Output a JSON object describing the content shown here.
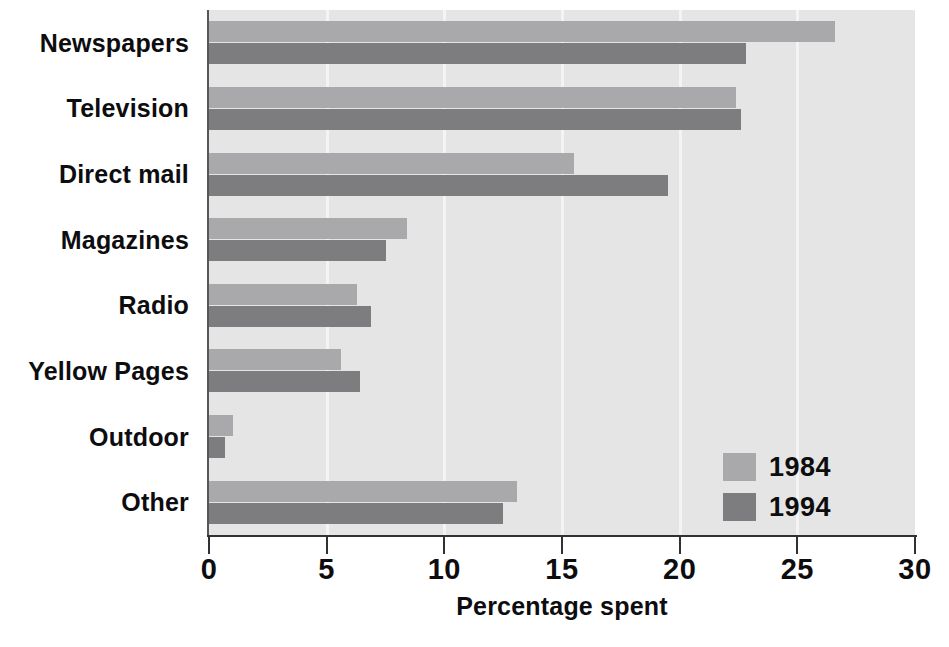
{
  "chart_data": {
    "type": "bar",
    "orientation": "horizontal",
    "title": "",
    "xlabel": "Percentage spent",
    "ylabel": "",
    "xlim": [
      0,
      30
    ],
    "xticks": [
      0,
      5,
      10,
      15,
      20,
      25,
      30
    ],
    "xtick_labels": [
      "0",
      "5",
      "10",
      "15",
      "20",
      "25",
      "30"
    ],
    "grid": true,
    "grid_axis": "x",
    "legend_position": "lower right",
    "categories": [
      "Newspapers",
      "Television",
      "Direct mail",
      "Magazines",
      "Radio",
      "Yellow Pages",
      "Outdoor",
      "Other"
    ],
    "series": [
      {
        "name": "1984",
        "color": "#a9a9ab",
        "values": [
          26.6,
          22.4,
          15.5,
          8.4,
          6.3,
          5.6,
          1.0,
          13.1
        ]
      },
      {
        "name": "1994",
        "color": "#7d7d80",
        "values": [
          22.8,
          22.6,
          19.5,
          7.5,
          6.9,
          6.4,
          0.7,
          12.5
        ]
      }
    ],
    "plot_background": "#e5e5e5",
    "page_background": "#ffffff",
    "axis_color": "#313135",
    "text_color": "#0d0d0f"
  }
}
